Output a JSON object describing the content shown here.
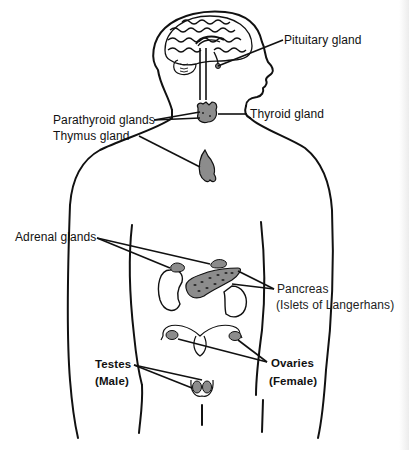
{
  "figure": {
    "labels": {
      "pituitary": "Pituitary gland",
      "thyroid": "Thyroid gland",
      "parathyroid": "Parathyroid glands",
      "thymus": "Thymus gland",
      "adrenal": "Adrenal glands",
      "pancreas_line1": "Pancreas",
      "pancreas_line2": "(Islets of Langerhans)",
      "testes_line1": "Testes",
      "testes_line2": "(Male)",
      "ovaries_line1": "Ovaries",
      "ovaries_line2": "(Female)"
    },
    "colors": {
      "outline": "#111111",
      "gland_fill": "#8c8c8c",
      "gland_spots": "#333333",
      "background": "#ffffff"
    }
  }
}
